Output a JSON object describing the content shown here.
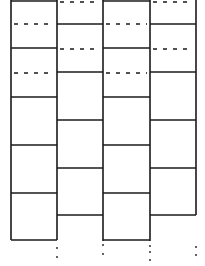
{
  "diagram": {
    "stroke": "#1a1a1a",
    "columns_x": [
      11,
      57,
      103,
      150,
      196
    ],
    "odd_columns": {
      "solid_y": [
        1,
        48,
        97,
        145,
        193,
        240
      ],
      "dashed_y": [
        24,
        73
      ]
    },
    "even_columns": {
      "solid_y": [
        24,
        72,
        120,
        168,
        215
      ],
      "dashed_y": [
        2,
        49
      ]
    }
  }
}
